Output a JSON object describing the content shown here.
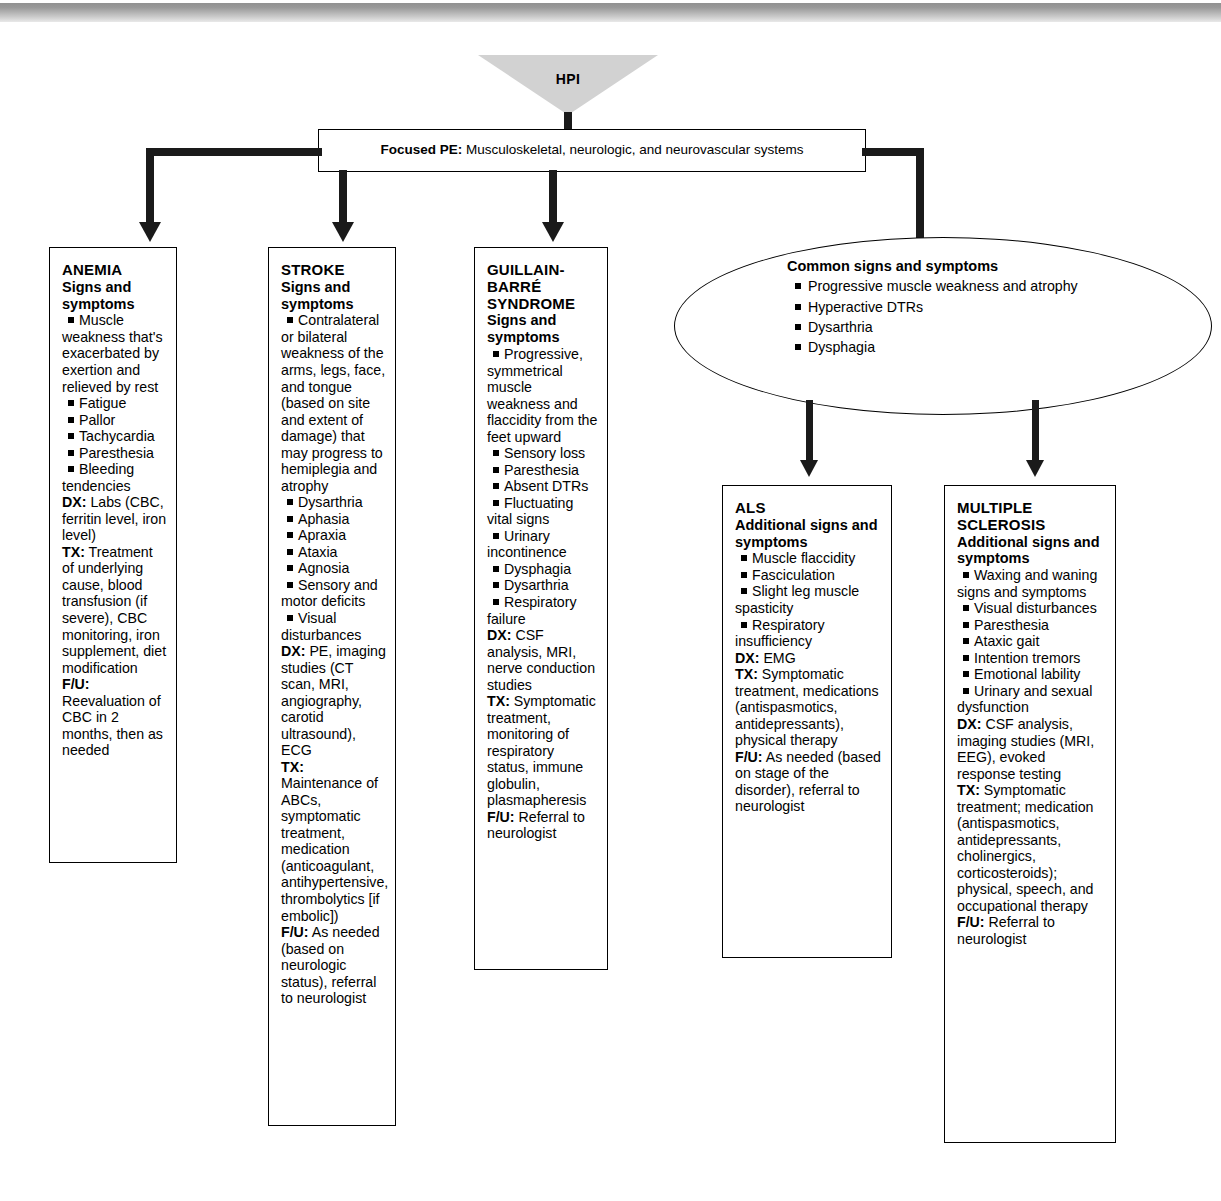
{
  "diagram": {
    "root": {
      "label": "HPI"
    },
    "focused_pe": {
      "label": "Focused PE:",
      "text": " Musculoskeletal, neurologic, and neurovascular systems"
    },
    "common_oval": {
      "title": "Common signs and symptoms",
      "items": [
        "Progressive muscle weakness and atrophy",
        "Hyperactive DTRs",
        "Dysarthria",
        "Dysphagia"
      ]
    },
    "boxes": [
      {
        "id": "anemia",
        "title": "ANEMIA",
        "subtitle": "Signs and symptoms",
        "bullets": [
          "Muscle weakness that's exacerbated by exertion and relieved by rest",
          "Fatigue",
          "Pallor",
          "Tachycardia",
          "Paresthesia",
          "Bleeding tendencies"
        ],
        "fields": [
          {
            "label": "DX:",
            "text": " Labs (CBC, ferritin level, iron level)"
          },
          {
            "label": "TX:",
            "text": " Treatment of underlying cause, blood transfusion (if severe), CBC monitoring, iron supplement, diet modification"
          },
          {
            "label": "F/U:",
            "text": " Reevaluation of CBC in 2 months, then as needed"
          }
        ]
      },
      {
        "id": "stroke",
        "title": "STROKE",
        "subtitle": "Signs and symptoms",
        "bullets": [
          "Contralateral or bilateral weakness of the arms, legs, face, and tongue (based on site and extent of damage) that may progress to hemiplegia and atrophy",
          "Dysarthria",
          "Aphasia",
          "Apraxia",
          "Ataxia",
          "Agnosia",
          "Sensory and motor deficits",
          "Visual disturbances"
        ],
        "fields": [
          {
            "label": "DX:",
            "text": " PE, imaging studies (CT scan, MRI, angiography, carotid ultrasound), ECG"
          },
          {
            "label": "TX:",
            "text": " Maintenance of ABCs, symptomatic treatment, medication (anticoagulant, antihypertensive, thrombolytics [if embolic])"
          },
          {
            "label": "F/U:",
            "text": " As needed (based on neurologic status), referral to neurologist"
          }
        ]
      },
      {
        "id": "guillain-barre",
        "title": "GUILLAIN-BARRÉ SYNDROME",
        "subtitle": "Signs and symptoms",
        "bullets": [
          "Progressive, symmetrical muscle weakness and flaccidity from the feet upward",
          "Sensory loss",
          "Paresthesia",
          "Absent DTRs",
          "Fluctuating vital signs",
          "Urinary incontinence",
          "Dysphagia",
          "Dysarthria",
          "Respiratory failure"
        ],
        "fields": [
          {
            "label": "DX:",
            "text": " CSF analysis, MRI, nerve conduction studies"
          },
          {
            "label": "TX:",
            "text": " Symptomatic treatment, monitoring of respiratory status, immune globulin, plasmapheresis"
          },
          {
            "label": "F/U:",
            "text": " Referral to neurologist"
          }
        ]
      },
      {
        "id": "als",
        "title": "ALS",
        "subtitle": "Additional signs and symptoms",
        "bullets": [
          "Muscle flaccidity",
          "Fasciculation",
          "Slight leg muscle spasticity",
          "Respiratory insufficiency"
        ],
        "fields": [
          {
            "label": "DX:",
            "text": " EMG"
          },
          {
            "label": "TX:",
            "text": " Symptomatic treatment, medications (antispasmotics, antidepressants), physical therapy"
          },
          {
            "label": "F/U:",
            "text": " As needed (based on stage of the disorder), referral to neurologist"
          }
        ]
      },
      {
        "id": "multiple-sclerosis",
        "title": "MULTIPLE SCLEROSIS",
        "subtitle": "Additional signs and symptoms",
        "bullets": [
          "Waxing and waning signs and symptoms",
          "Visual disturbances",
          "Paresthesia",
          "Ataxic gait",
          "Intention tremors",
          "Emotional lability",
          "Urinary and sexual dysfunction"
        ],
        "fields": [
          {
            "label": "DX:",
            "text": " CSF analysis, imaging studies (MRI, EEG), evoked response testing"
          },
          {
            "label": "TX:",
            "text": " Symptomatic treatment; medication (antispasmotics, antidepressants, cholinergics, corticosteroids); physical, speech, and occupational therapy"
          },
          {
            "label": "F/U:",
            "text": " Referral to neurologist"
          }
        ]
      }
    ]
  },
  "colors": {
    "line": "#1a1a1a",
    "band_top": "#8b8b8b",
    "funnel": "#d2d2d2"
  }
}
